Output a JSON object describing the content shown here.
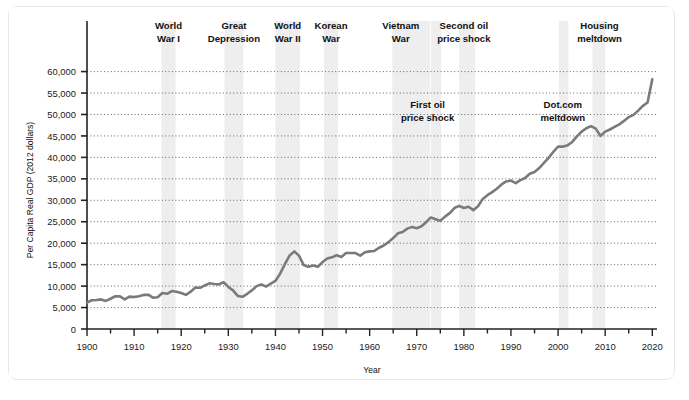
{
  "chart_data": {
    "type": "line",
    "title": "",
    "xlabel": "Year",
    "ylabel": "Per Capita Real GDP (2012 dollars)",
    "xlim": [
      1900,
      2021
    ],
    "ylim": [
      0,
      62000
    ],
    "grid": "horizontal-dotted",
    "legend": "none",
    "line_color": "#7a7a7a",
    "band_color": "#eeeeee",
    "x_ticks": [
      1900,
      1910,
      1920,
      1930,
      1940,
      1950,
      1960,
      1970,
      1980,
      1990,
      2000,
      2010,
      2020
    ],
    "x_tick_labels": [
      "1900",
      "1910",
      "1920",
      "1930",
      "1940",
      "1950",
      "1960",
      "1970",
      "1980",
      "1990",
      "2000",
      "2010",
      "2020"
    ],
    "x_minor_step": 5,
    "y_ticks": [
      0,
      5000,
      10000,
      15000,
      20000,
      25000,
      30000,
      35000,
      40000,
      45000,
      50000,
      55000,
      60000
    ],
    "y_tick_labels": [
      "0",
      "5,000",
      "10,000",
      "15,000",
      "20,000",
      "25,000",
      "30,000",
      "35,000",
      "40,000",
      "45,000",
      "50,000",
      "55,000",
      "60,000"
    ],
    "series": [
      {
        "name": "Per Capita Real GDP",
        "x": [
          1900,
          1901,
          1902,
          1903,
          1904,
          1905,
          1906,
          1907,
          1908,
          1909,
          1910,
          1911,
          1912,
          1913,
          1914,
          1915,
          1916,
          1917,
          1918,
          1919,
          1920,
          1921,
          1922,
          1923,
          1924,
          1925,
          1926,
          1927,
          1928,
          1929,
          1930,
          1931,
          1932,
          1933,
          1934,
          1935,
          1936,
          1937,
          1938,
          1939,
          1940,
          1941,
          1942,
          1943,
          1944,
          1945,
          1946,
          1947,
          1948,
          1949,
          1950,
          1951,
          1952,
          1953,
          1954,
          1955,
          1956,
          1957,
          1958,
          1959,
          1960,
          1961,
          1962,
          1963,
          1964,
          1965,
          1966,
          1967,
          1968,
          1969,
          1970,
          1971,
          1972,
          1973,
          1974,
          1975,
          1976,
          1977,
          1978,
          1979,
          1980,
          1981,
          1982,
          1983,
          1984,
          1985,
          1986,
          1987,
          1988,
          1989,
          1990,
          1991,
          1992,
          1993,
          1994,
          1995,
          1996,
          1997,
          1998,
          1999,
          2000,
          2001,
          2002,
          2003,
          2004,
          2005,
          2006,
          2007,
          2008,
          2009,
          2010,
          2011,
          2012,
          2013,
          2014,
          2015,
          2016,
          2017,
          2018,
          2019,
          2020
        ],
        "values": [
          6150,
          6700,
          6750,
          6900,
          6550,
          7050,
          7650,
          7600,
          6900,
          7550,
          7450,
          7650,
          7950,
          8000,
          7300,
          7400,
          8400,
          8200,
          8850,
          8700,
          8400,
          7950,
          8700,
          9650,
          9600,
          10150,
          10650,
          10500,
          10400,
          10900,
          9800,
          9000,
          7700,
          7500,
          8200,
          9000,
          10000,
          10400,
          9900,
          10550,
          11200,
          12900,
          15100,
          17100,
          18100,
          17100,
          14900,
          14500,
          14800,
          14500,
          15600,
          16450,
          16700,
          17200,
          16800,
          17700,
          17700,
          17700,
          17100,
          17900,
          18100,
          18200,
          18950,
          19450,
          20250,
          21200,
          22300,
          22600,
          23400,
          23800,
          23500,
          23950,
          24900,
          26000,
          25600,
          25200,
          26200,
          27000,
          28200,
          28700,
          28200,
          28500,
          27700,
          28600,
          30300,
          31200,
          31900,
          32700,
          33700,
          34400,
          34600,
          34000,
          34700,
          35200,
          36200,
          36600,
          37500,
          38700,
          39900,
          41300,
          42500,
          42500,
          42800,
          43600,
          44900,
          46000,
          46800,
          47300,
          46700,
          45000,
          46000,
          46500,
          47100,
          47700,
          48500,
          49400,
          49900,
          50900,
          52000,
          52800,
          58200
        ]
      }
    ],
    "shaded_bands": [
      {
        "label": "World War I",
        "start": 1915.8,
        "end": 1918.8,
        "label_lines": [
          "World",
          "War I"
        ],
        "label_x": 1917.3
      },
      {
        "label": "Great Depression",
        "start": 1929.2,
        "end": 1933.2,
        "label_lines": [
          "Great",
          "Depression"
        ],
        "label_x": 1931.2
      },
      {
        "label": "World War II",
        "start": 1940.0,
        "end": 1945.2,
        "label_lines": [
          "World",
          "War II"
        ],
        "label_x": 1942.6
      },
      {
        "label": "Korean War",
        "start": 1950.3,
        "end": 1953.3,
        "label_lines": [
          "Korean",
          "War"
        ],
        "label_x": 1951.8
      },
      {
        "label": "Vietnam War",
        "start": 1964.8,
        "end": 1972.8,
        "label_lines": [
          "Vietnam",
          "War"
        ],
        "label_x": 1966.6
      },
      {
        "label": "First oil price shock",
        "start": 1973.0,
        "end": 1975.2,
        "label_lines": [
          "First oil",
          "price shock"
        ],
        "label_x": 1972.0
      },
      {
        "label": "Second oil price shock",
        "start": 1979.0,
        "end": 1982.4,
        "label_lines": [
          "Second oil",
          "price shock"
        ],
        "label_x": 1979.2
      },
      {
        "label": "Dot.com meltdown",
        "start": 2000.2,
        "end": 2002.2,
        "label_lines": [
          "Dot.com",
          "meltdown"
        ],
        "label_x": 2000.6
      },
      {
        "label": "Housing meltdown",
        "start": 2007.3,
        "end": 2010.0,
        "label_lines": [
          "Housing",
          "meltdown"
        ],
        "label_x": 2008.5
      }
    ],
    "annotations_top": [
      {
        "lines": [
          "World",
          "War I"
        ],
        "x": 1917.3
      },
      {
        "lines": [
          "Great",
          "Depression"
        ],
        "x": 1931.2
      },
      {
        "lines": [
          "World",
          "War II"
        ],
        "x": 1942.6
      },
      {
        "lines": [
          "Korean",
          "War"
        ],
        "x": 1951.8
      },
      {
        "lines": [
          "Vietnam",
          "War"
        ],
        "x": 1966.6
      },
      {
        "lines": [
          "Second oil",
          "price shock"
        ],
        "x": 1980.0
      },
      {
        "lines": [
          "Housing",
          "meltdown"
        ],
        "x": 2008.8
      }
    ],
    "annotations_inner": [
      {
        "lines": [
          "First oil",
          "price shock"
        ],
        "x": 1972.3,
        "y": 51500
      },
      {
        "lines": [
          "Dot.com",
          "meltdown"
        ],
        "x": 2001.0,
        "y": 51500
      }
    ]
  }
}
